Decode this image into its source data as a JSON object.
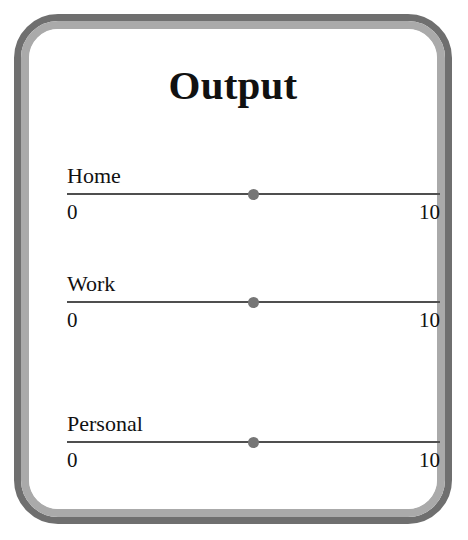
{
  "card": {
    "title": "Output",
    "border_outer_color": "#6f6f6f",
    "border_inner_color": "#aaaaaa",
    "background_color": "#ffffff"
  },
  "sliders": [
    {
      "label": "Home",
      "min_label": "0",
      "max_label": "10",
      "min": 0,
      "max": 10,
      "value": 5,
      "track_color": "#4f4f4f",
      "thumb_color": "#767676"
    },
    {
      "label": "Work",
      "min_label": "0",
      "max_label": "10",
      "min": 0,
      "max": 10,
      "value": 5,
      "track_color": "#4f4f4f",
      "thumb_color": "#767676"
    },
    {
      "label": "Personal",
      "min_label": "0",
      "max_label": "10",
      "min": 0,
      "max": 10,
      "value": 5,
      "track_color": "#4f4f4f",
      "thumb_color": "#767676"
    }
  ]
}
